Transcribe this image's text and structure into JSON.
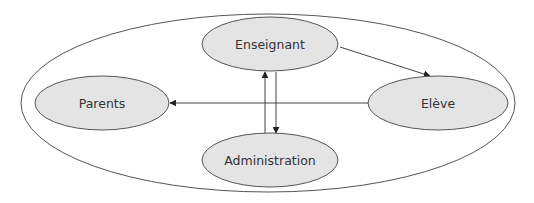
{
  "diagram": {
    "type": "relationship-diagram",
    "container": {
      "shape": "ellipse",
      "cx": 268,
      "cy": 103,
      "rx": 247,
      "ry": 89,
      "stroke": "#555555",
      "fill": "#ffffff"
    },
    "nodes": [
      {
        "id": "enseignant",
        "label": "Enseignant",
        "cx": 270,
        "cy": 44,
        "rx": 68,
        "ry": 27
      },
      {
        "id": "parents",
        "label": "Parents",
        "cx": 102,
        "cy": 103,
        "rx": 67,
        "ry": 27
      },
      {
        "id": "eleve",
        "label": "Elève",
        "cx": 438,
        "cy": 103,
        "rx": 70,
        "ry": 27
      },
      {
        "id": "administration",
        "label": "Administration",
        "cx": 270,
        "cy": 160,
        "rx": 68,
        "ry": 27
      }
    ],
    "edges": [
      {
        "from": "enseignant",
        "to": "eleve",
        "x1": 340,
        "y1": 47,
        "x2": 430,
        "y2": 76
      },
      {
        "from": "eleve",
        "to": "parents",
        "x1": 368,
        "y1": 103,
        "x2": 170,
        "y2": 103
      },
      {
        "from": "administration",
        "to": "enseignant",
        "x1": 265,
        "y1": 133,
        "x2": 265,
        "y2": 72
      },
      {
        "from": "enseignant",
        "to": "administration",
        "x1": 276,
        "y1": 72,
        "x2": 276,
        "y2": 133
      }
    ],
    "colors": {
      "node_fill": "#e4e4e4",
      "node_stroke": "#555555",
      "edge_stroke": "#444444",
      "text": "#333333"
    }
  }
}
